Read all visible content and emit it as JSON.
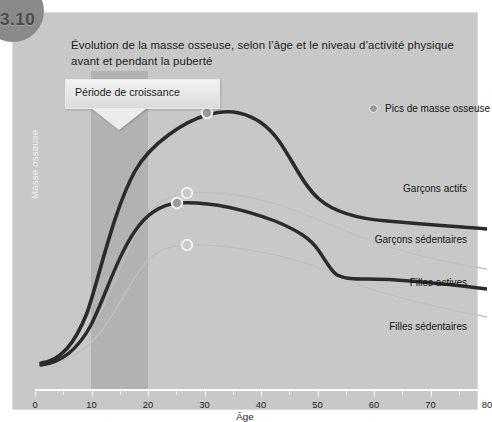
{
  "figure": {
    "number": "3.10"
  },
  "title": "Évolution de la masse osseuse, selon l’âge et le niveau d’activité physique avant et pendant la puberté",
  "callout": {
    "label": "Période de croissance"
  },
  "legend": {
    "marker_label": "Pics de masse osseuse",
    "marker_color": "#9a9a9a"
  },
  "axes": {
    "xlabel": "Âge",
    "ylabel": "Masse osseuse",
    "xticks": [
      "0",
      "10",
      "20",
      "30",
      "40",
      "50",
      "60",
      "70",
      "80"
    ]
  },
  "colors": {
    "panel": "#c8c8c8",
    "band": "rgba(130,130,130,0.30)",
    "thick_curve": "#2b2b2b",
    "thin_curve": "#bdbdbd",
    "axis": "#ffffff",
    "badge": "#8a8a8a"
  },
  "chart_data": {
    "type": "line",
    "title": "Évolution de la masse osseuse, selon l’âge et le niveau d’activité physique avant et pendant la puberté",
    "xlabel": "Âge",
    "ylabel": "Masse osseuse",
    "xlim": [
      0,
      80
    ],
    "ylim": [
      0,
      100
    ],
    "grid": false,
    "legend_position": "top-right",
    "annotations": [
      {
        "text": "Période de croissance",
        "x_range": [
          10,
          20
        ],
        "kind": "shaded-band-callout"
      },
      {
        "text": "Pics de masse osseuse",
        "kind": "legend-marker"
      }
    ],
    "x": [
      0,
      5,
      10,
      15,
      20,
      25,
      30,
      35,
      40,
      45,
      50,
      55,
      60,
      65,
      70,
      75,
      80
    ],
    "series": [
      {
        "name": "Garçons actifs",
        "style": "thick-dark",
        "color": "#2b2b2b",
        "peak": {
          "x": 30,
          "y": 95
        },
        "values": [
          12,
          15,
          26,
          55,
          83,
          93,
          95,
          94,
          92,
          87,
          78,
          72,
          69,
          67,
          65,
          63,
          61
        ]
      },
      {
        "name": "Filles actives",
        "style": "thin-light",
        "color": "#bdbdbd",
        "peak": {
          "x": 28,
          "y": 79
        },
        "values": [
          11,
          14,
          24,
          52,
          74,
          78,
          79,
          78,
          76,
          72,
          66,
          61,
          58,
          56,
          54,
          52,
          50
        ]
      },
      {
        "name": "Garçons sédentaires",
        "style": "thick-dark",
        "color": "#2b2b2b",
        "peak": {
          "x": 24,
          "y": 64
        },
        "values": [
          10,
          13,
          21,
          45,
          62,
          64,
          64,
          63,
          61,
          58,
          49,
          43,
          41,
          39,
          37,
          35,
          33
        ]
      },
      {
        "name": "Filles sédentaires",
        "style": "thin-light",
        "color": "#bdbdbd",
        "peak": {
          "x": 24,
          "y": 47
        },
        "values": [
          9,
          12,
          19,
          36,
          46,
          47,
          47,
          46,
          45,
          42,
          36,
          31,
          28,
          26,
          24,
          22,
          20
        ]
      }
    ]
  },
  "series_labels": [
    {
      "name": "Garçons actifs"
    },
    {
      "name": "Garçons sédentaires"
    },
    {
      "name": "Filles actives"
    },
    {
      "name": "Filles sédentaires"
    }
  ]
}
